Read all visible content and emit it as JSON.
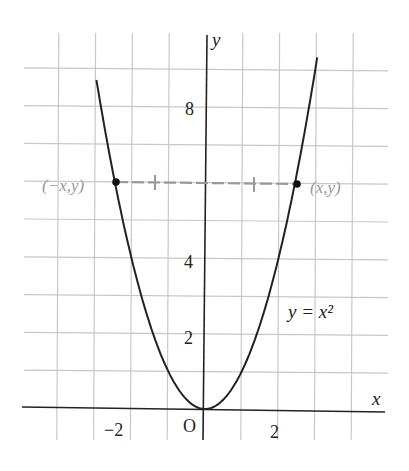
{
  "chart_data": {
    "type": "line",
    "title": "",
    "function": "y = x^2",
    "curve_label": "y = x²",
    "xlabel": "x",
    "ylabel": "y",
    "origin_label": "O",
    "x_ticks": [
      {
        "value": -2,
        "label": "−2"
      },
      {
        "value": 2,
        "label": "2"
      }
    ],
    "y_ticks": [
      {
        "value": 2,
        "label": "2"
      },
      {
        "value": 4,
        "label": "4"
      },
      {
        "value": 8,
        "label": "8"
      }
    ],
    "xlim": [
      -4,
      4
    ],
    "ylim": [
      0,
      9
    ],
    "grid": true,
    "x": [
      -2.45,
      -2,
      -1.5,
      -1,
      -0.5,
      0,
      0.5,
      1,
      1.5,
      2,
      2.45
    ],
    "y": [
      6,
      4,
      2.25,
      1,
      0.25,
      0,
      0.25,
      1,
      2.25,
      4,
      6
    ],
    "annotations": [
      {
        "type": "point",
        "x": -2.45,
        "y": 6,
        "label": "(−x,y)"
      },
      {
        "type": "point",
        "x": 2.45,
        "y": 6,
        "label": "(x,y)"
      },
      {
        "type": "dashed-segment",
        "from": [
          -2.45,
          6
        ],
        "to": [
          2.45,
          6
        ],
        "tick_marks": 2
      }
    ]
  }
}
